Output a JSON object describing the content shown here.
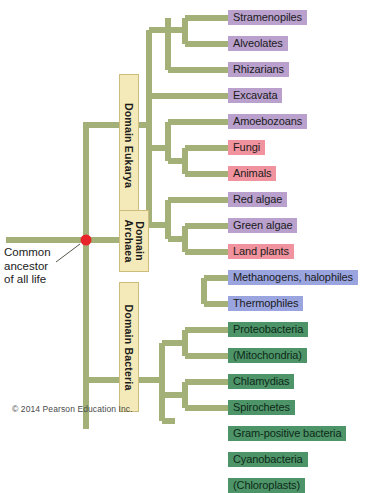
{
  "figure": {
    "root_label": "Common ancestor\nof all life",
    "root_node_color": "#e8232a",
    "branch_color": "#a3b179",
    "copyright": "© 2014 Pearson Education Inc."
  },
  "domains": [
    {
      "id": "eukarya",
      "label": "Domain Eukarya",
      "box_color": "#f4e9b8"
    },
    {
      "id": "archaea",
      "label": "Domain\nArchaea",
      "box_color": "#f4e9b8"
    },
    {
      "id": "bacteria",
      "label": "Domain Bacteria",
      "box_color": "#f4e9b8"
    }
  ],
  "taxa": [
    {
      "name": "Stramenopiles",
      "domain": "eukarya",
      "color": "#b9a0cd",
      "y": 18
    },
    {
      "name": "Alveolates",
      "domain": "eukarya",
      "color": "#b9a0cd",
      "y": 44
    },
    {
      "name": "Rhizarians",
      "domain": "eukarya",
      "color": "#b9a0cd",
      "y": 70
    },
    {
      "name": "Excavata",
      "domain": "eukarya",
      "color": "#b9a0cd",
      "y": 96
    },
    {
      "name": "Amoebozoans",
      "domain": "eukarya",
      "color": "#b9a0cd",
      "y": 122
    },
    {
      "name": "Fungi",
      "domain": "eukarya",
      "color": "#f0939e",
      "y": 148
    },
    {
      "name": "Animals",
      "domain": "eukarya",
      "color": "#f0939e",
      "y": 174
    },
    {
      "name": "Red algae",
      "domain": "eukarya",
      "color": "#b9a0cd",
      "y": 200
    },
    {
      "name": "Green algae",
      "domain": "eukarya",
      "color": "#b9a0cd",
      "y": 226
    },
    {
      "name": "Land plants",
      "domain": "eukarya",
      "color": "#f0939e",
      "y": 252
    },
    {
      "name": "Methanogens, halophiles",
      "domain": "archaea",
      "color": "#9aa5e0",
      "y": 278
    },
    {
      "name": "Thermophiles",
      "domain": "archaea",
      "color": "#9aa5e0",
      "y": 304
    },
    {
      "name": "Proteobacteria",
      "domain": "bacteria",
      "color": "#4e9469",
      "y": 330
    },
    {
      "name": "(Mitochondria)",
      "domain": "bacteria",
      "color": "#4e9469",
      "y": 356
    },
    {
      "name": "Chlamydias",
      "domain": "bacteria",
      "color": "#4e9469",
      "y": 382
    },
    {
      "name": "Spirochetes",
      "domain": "bacteria",
      "color": "#4e9469",
      "y": 408
    },
    {
      "name": "Gram-positive bacteria",
      "domain": "bacteria",
      "color": "#4e9469",
      "y": 434
    },
    {
      "name": "Cyanobacteria",
      "domain": "bacteria",
      "color": "#4e9469",
      "y": 460
    },
    {
      "name": "(Chloroplasts)",
      "domain": "bacteria",
      "color": "#4e9469",
      "y": 486
    }
  ],
  "chart_data": {
    "type": "diagram",
    "subtype": "cladogram",
    "root": "Common ancestor of all life",
    "tips": [
      "Stramenopiles",
      "Alveolates",
      "Rhizarians",
      "Excavata",
      "Amoebozoans",
      "Fungi",
      "Animals",
      "Red algae",
      "Green algae",
      "Land plants",
      "Methanogens, halophiles",
      "Thermophiles",
      "Proteobacteria",
      "(Mitochondria)",
      "Chlamydias",
      "Spirochetes",
      "Gram-positive bacteria",
      "Cyanobacteria",
      "(Chloroplasts)"
    ],
    "groups": {
      "Domain Eukarya": [
        "Stramenopiles",
        "Alveolates",
        "Rhizarians",
        "Excavata",
        "Amoebozoans",
        "Fungi",
        "Animals",
        "Red algae",
        "Green algae",
        "Land plants"
      ],
      "Domain Archaea": [
        "Methanogens, halophiles",
        "Thermophiles"
      ],
      "Domain Bacteria": [
        "Proteobacteria",
        "(Mitochondria)",
        "Chlamydias",
        "Spirochetes",
        "Gram-positive bacteria",
        "Cyanobacteria",
        "(Chloroplasts)"
      ]
    },
    "topology": "(((Stramenopiles,Alveolates),Rhizarians),Excavata,(Amoebozoans,(Fungi,Animals)),(Red algae,(Green algae,Land plants)))Eukarya,((Methanogens, halophiles),Thermophiles)Archaea,((Proteobacteria,(Mitochondria)),(Chlamydias,Spirochetes),(Gram-positive bacteria,(Cyanobacteria,(Chloroplasts))))Bacteria"
  }
}
